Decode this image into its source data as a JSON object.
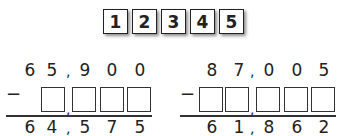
{
  "tiles": [
    "1",
    "2",
    "3",
    "4",
    "5"
  ],
  "problems": [
    {
      "top": [
        "6",
        "5",
        "9",
        "0",
        "0"
      ],
      "bottom": [
        "6",
        "4",
        "5",
        "7",
        "5"
      ],
      "operator": "−",
      "comma": ","
    },
    {
      "top": [
        "8",
        "7",
        "0",
        "0",
        "5"
      ],
      "bottom": [
        "6",
        "1",
        "8",
        "6",
        "2"
      ],
      "operator": "−",
      "comma": ","
    }
  ]
}
